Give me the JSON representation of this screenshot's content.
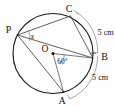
{
  "figure": {
    "kind": "circle-geometry-diagram",
    "stroke_color": "#1b1b1b",
    "chord_color": "#3a3a3a",
    "arc_mark_color": "#8d8d8d",
    "background_color": "#fdfdfd"
  },
  "labels": {
    "point_p": "P",
    "point_c": "C",
    "point_b": "B",
    "point_a": "A",
    "centre_o": "O",
    "angle_at_p": "x",
    "central_angle": "60°",
    "arc_cb_length": "5 cm",
    "arc_ba_length": "5 cm"
  },
  "geometry": {
    "circle": {
      "cx": 53,
      "cy": 53.5,
      "r": 40
    },
    "points": {
      "P": {
        "x": 17.5,
        "y": 35.0
      },
      "C": {
        "x": 70.5,
        "y": 16.0
      },
      "B": {
        "x": 92.8,
        "y": 58.0
      },
      "A": {
        "x": 63.5,
        "y": 92.0
      },
      "O": {
        "x": 53.0,
        "y": 53.5
      }
    },
    "segments": [
      {
        "name": "chord-PC",
        "from": "P",
        "to": "C"
      },
      {
        "name": "chord-PB",
        "from": "P",
        "to": "B"
      },
      {
        "name": "chord-PA",
        "from": "P",
        "to": "A"
      },
      {
        "name": "chord-CB",
        "from": "C",
        "to": "B"
      },
      {
        "name": "radius-OB",
        "from": "O",
        "to": "B"
      },
      {
        "name": "radius-OA",
        "from": "O",
        "to": "A"
      }
    ]
  },
  "measures": {
    "central_angle_degrees": 60,
    "arc_cb_cm": 5,
    "arc_ba_cm": 5,
    "unknown_inscribed_angle": "x"
  }
}
